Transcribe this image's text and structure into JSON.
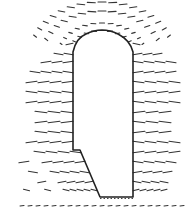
{
  "figure": {
    "type": "vector-field-diagram",
    "width": 195,
    "height": 219,
    "colors": {
      "background": "#ffffff",
      "ink": "#222222"
    },
    "outline": {
      "description": "closed body outline with arched top, straight right wall, left wall with diagonal lower section",
      "path": "M73,150 L73,52 Q76,38 86,34 Q102,26 118,34 Q130,40 133,52 L133,197 L100,197 L80,150 Z"
    },
    "bottom_dashed_line": {
      "x1": 100,
      "x2": 133,
      "y": 197
    },
    "vector_rows_left": [
      {
        "y": 44,
        "x_start": 62,
        "x_end": 74,
        "len": 7
      },
      {
        "y": 54,
        "x_start": 44,
        "x_end": 74,
        "len": 9
      },
      {
        "y": 62,
        "x_start": 30,
        "x_end": 74,
        "len": 10
      },
      {
        "y": 72,
        "x_start": 20,
        "x_end": 74,
        "len": 10
      },
      {
        "y": 82,
        "x_start": 14,
        "x_end": 74,
        "len": 11
      },
      {
        "y": 92,
        "x_start": 14,
        "x_end": 74,
        "len": 11
      },
      {
        "y": 102,
        "x_start": 14,
        "x_end": 74,
        "len": 11
      },
      {
        "y": 112,
        "x_start": 14,
        "x_end": 74,
        "len": 12
      },
      {
        "y": 122,
        "x_start": 14,
        "x_end": 74,
        "len": 12
      },
      {
        "y": 132,
        "x_start": 14,
        "x_end": 74,
        "len": 12
      },
      {
        "y": 142,
        "x_start": 14,
        "x_end": 74,
        "len": 11
      },
      {
        "y": 152,
        "x_start": 14,
        "x_end": 82,
        "len": 11
      },
      {
        "y": 162,
        "x_start": 14,
        "x_end": 86,
        "len": 10
      },
      {
        "y": 172,
        "x_start": 16,
        "x_end": 90,
        "len": 9
      },
      {
        "y": 182,
        "x_start": 18,
        "x_end": 94,
        "len": 8
      },
      {
        "y": 190,
        "x_start": 22,
        "x_end": 98,
        "len": 6
      }
    ],
    "vector_rows_right": [
      {
        "y": 44,
        "x_start": 132,
        "x_end": 146,
        "len": 7
      },
      {
        "y": 54,
        "x_start": 132,
        "x_end": 165,
        "len": 9
      },
      {
        "y": 62,
        "x_start": 132,
        "x_end": 178,
        "len": 10
      },
      {
        "y": 72,
        "x_start": 132,
        "x_end": 186,
        "len": 10
      },
      {
        "y": 82,
        "x_start": 132,
        "x_end": 188,
        "len": 11
      },
      {
        "y": 92,
        "x_start": 132,
        "x_end": 188,
        "len": 11
      },
      {
        "y": 102,
        "x_start": 132,
        "x_end": 188,
        "len": 11
      },
      {
        "y": 112,
        "x_start": 132,
        "x_end": 188,
        "len": 12
      },
      {
        "y": 122,
        "x_start": 132,
        "x_end": 188,
        "len": 12
      },
      {
        "y": 132,
        "x_start": 132,
        "x_end": 188,
        "len": 12
      },
      {
        "y": 142,
        "x_start": 132,
        "x_end": 188,
        "len": 11
      },
      {
        "y": 152,
        "x_start": 132,
        "x_end": 188,
        "len": 11
      },
      {
        "y": 162,
        "x_start": 132,
        "x_end": 188,
        "len": 10
      },
      {
        "y": 172,
        "x_start": 132,
        "x_end": 186,
        "len": 9
      },
      {
        "y": 182,
        "x_start": 132,
        "x_end": 184,
        "len": 8
      },
      {
        "y": 190,
        "x_start": 132,
        "x_end": 180,
        "len": 6
      }
    ],
    "top_arc_vectors": {
      "cx": 102,
      "cy": 56,
      "radii": [
        34,
        44,
        60,
        72
      ],
      "count": [
        11,
        13,
        15,
        17
      ]
    },
    "bottom_row": {
      "y": 206,
      "x_start": 20,
      "x_end": 188,
      "spacing": 8,
      "len": 4
    }
  }
}
